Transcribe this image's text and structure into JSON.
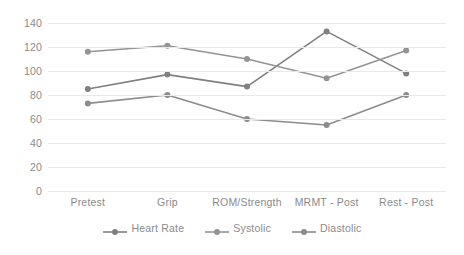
{
  "chart_data": {
    "type": "line",
    "title": "",
    "subtitle": "",
    "xlabel": "",
    "ylabel": "",
    "categories": [
      "Pretest",
      "Grip",
      "ROM/Strength",
      "MRMT - Post",
      "Rest - Post"
    ],
    "series": [
      {
        "name": "Heart Rate",
        "values": [
          85,
          97,
          87,
          133,
          98
        ],
        "color": "#808080"
      },
      {
        "name": "Systolic",
        "values": [
          116,
          121,
          110,
          94,
          117
        ],
        "color": "#949494"
      },
      {
        "name": "Diastolic",
        "values": [
          73,
          80,
          60,
          55,
          80
        ],
        "color": "#8c8c8c"
      }
    ],
    "ylim": [
      0,
      140
    ],
    "yticks": [
      0,
      20,
      40,
      60,
      80,
      100,
      120,
      140
    ],
    "ytick_labels": [
      "0",
      "20",
      "40",
      "60",
      "80",
      "100",
      "120",
      "140"
    ],
    "grid": true,
    "grid_color": "#e8e8e8",
    "legend_position": "bottom",
    "background": "#ffffff",
    "marker": "circle"
  }
}
